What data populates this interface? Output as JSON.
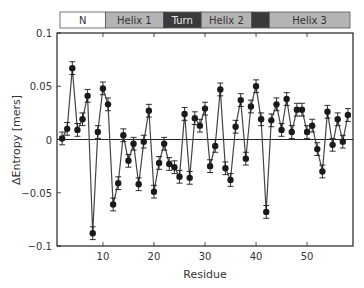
{
  "chart_data": {
    "type": "line",
    "title": "",
    "xlabel": "Residue",
    "ylabel": "ΔEntropy [mers]",
    "xlim": [
      1,
      59
    ],
    "ylim": [
      -0.1,
      0.1
    ],
    "xticks": [
      10,
      20,
      30,
      40,
      50
    ],
    "yticks": [
      -0.1,
      -0.05,
      0,
      0.05,
      0.1
    ],
    "ytick_labels": [
      "-0.1",
      "-0.05",
      "0",
      "0.05",
      "0.1"
    ],
    "grid": false,
    "zero_line": true,
    "markers": "filled-circle",
    "error_bars": true,
    "error_magnitude": 0.006,
    "legend": null,
    "x": [
      2,
      3,
      4,
      5,
      6,
      7,
      8,
      9,
      10,
      11,
      12,
      13,
      14,
      15,
      16,
      17,
      18,
      19,
      20,
      21,
      22,
      23,
      24,
      25,
      26,
      27,
      28,
      29,
      30,
      31,
      32,
      33,
      34,
      35,
      36,
      37,
      38,
      39,
      40,
      41,
      42,
      43,
      44,
      45,
      46,
      47,
      48,
      49,
      50,
      51,
      52,
      53,
      54,
      55,
      56,
      57,
      58
    ],
    "series": [
      {
        "name": "ΔEntropy",
        "values": [
          0.001,
          0.01,
          0.067,
          0.009,
          0.019,
          0.041,
          -0.088,
          0.007,
          0.048,
          0.033,
          -0.061,
          -0.041,
          0.004,
          -0.02,
          -0.004,
          -0.042,
          -0.002,
          0.027,
          -0.049,
          -0.022,
          -0.004,
          -0.023,
          -0.026,
          -0.035,
          0.024,
          -0.036,
          0.02,
          0.013,
          0.029,
          -0.025,
          -0.006,
          0.047,
          -0.027,
          -0.038,
          0.012,
          0.037,
          -0.018,
          0.031,
          0.05,
          0.019,
          -0.068,
          0.018,
          0.033,
          0.009,
          0.038,
          0.007,
          0.028,
          0.028,
          0.007,
          0.013,
          -0.009,
          -0.03,
          0.026,
          -0.005,
          0.019,
          -0.002,
          0.023
        ]
      }
    ],
    "secondary_structure": [
      {
        "label": "N",
        "start": 1,
        "end": 10,
        "fill": "#ffffff",
        "text": "#333333"
      },
      {
        "label": "Helix 1",
        "start": 10,
        "end": 21.5,
        "fill": "#b4b4b4",
        "text": "#333333"
      },
      {
        "label": "Turn",
        "start": 21.5,
        "end": 29,
        "fill": "#3a3a3a",
        "text": "#e8e8e8"
      },
      {
        "label": "Helix 2",
        "start": 29,
        "end": 39,
        "fill": "#b4b4b4",
        "text": "#333333"
      },
      {
        "label": "",
        "start": 39,
        "end": 42.5,
        "fill": "#3a3a3a",
        "text": "#e8e8e8"
      },
      {
        "label": "Helix 3",
        "start": 42.5,
        "end": 58.5,
        "fill": "#b4b4b4",
        "text": "#333333"
      }
    ]
  },
  "colors": {
    "line": "#444444",
    "marker": "#1a1a1a",
    "axis": "#222222"
  }
}
